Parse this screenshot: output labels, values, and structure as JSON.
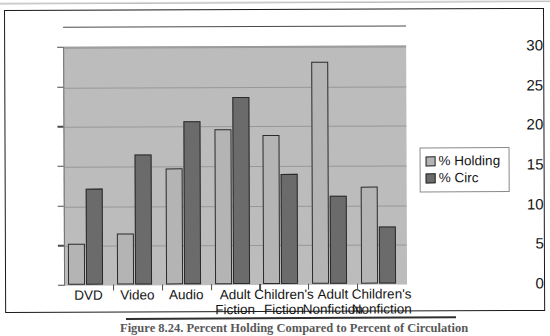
{
  "figure": {
    "caption": "Figure 8.24.  Percent Holding Compared to Percent of Circulation"
  },
  "legend": {
    "items": [
      {
        "label": "% Holding",
        "color": "#b4b4b4",
        "swatch": "legend-swatch-holding"
      },
      {
        "label": "% Circ",
        "color": "#6b6b6b",
        "swatch": "legend-swatch-circ"
      }
    ]
  },
  "chart_data": {
    "type": "bar",
    "title": "Figure 8.24.  Percent Holding Compared to Percent of Circulation",
    "xlabel": "",
    "ylabel": "",
    "ylim": [
      0,
      30
    ],
    "yticks": [
      0,
      5,
      10,
      15,
      20,
      25,
      30
    ],
    "ytick_labels": [
      "0",
      "5",
      "10",
      "15",
      "20",
      "25",
      "30"
    ],
    "grid": true,
    "legend_position": "right",
    "categories": [
      "DVD",
      "Video",
      "Audio",
      "Adult Fiction",
      "Children's Fiction",
      "Adult Nonfiction",
      "Children's Nonfiction"
    ],
    "category_lines": [
      [
        "DVD"
      ],
      [
        "Video"
      ],
      [
        "Audio"
      ],
      [
        "Adult",
        "Fiction"
      ],
      [
        "Children's",
        "Fiction"
      ],
      [
        "Adult",
        "Nonfiction"
      ],
      [
        "Children's",
        "Nonfiction"
      ]
    ],
    "series": [
      {
        "name": "% Holding",
        "color": "#b4b4b4",
        "values": [
          5.2,
          6.4,
          14.6,
          19.6,
          18.8,
          28.0,
          12.2
        ]
      },
      {
        "name": "% Circ",
        "color": "#6b6b6b",
        "values": [
          12.1,
          16.4,
          20.5,
          23.6,
          13.9,
          11.1,
          7.2
        ]
      }
    ]
  }
}
